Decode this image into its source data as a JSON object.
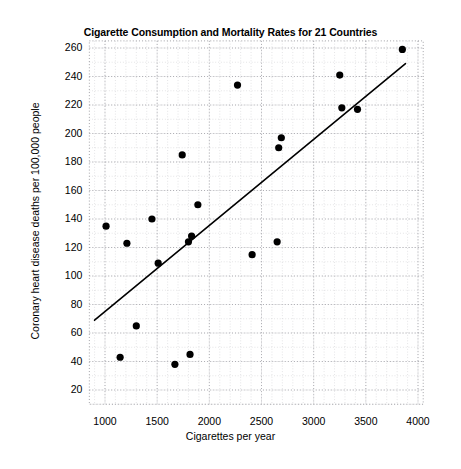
{
  "figure": {
    "background_color": "#ffffff",
    "width": 461,
    "height": 469
  },
  "top_strip_text": "",
  "chart_data": {
    "type": "scatter",
    "title": "Cigarette Consumption and Mortality Rates for 21 Countries",
    "xlabel": "Cigarettes per year",
    "ylabel": "Coronary heart disease deaths per 100,000 people",
    "xlim": [
      850,
      4050
    ],
    "ylim": [
      10,
      265
    ],
    "xticks": [
      1000,
      1500,
      2000,
      2500,
      3000,
      3500,
      4000
    ],
    "xtick_labels": [
      "1000",
      "1500",
      "2000",
      "2500",
      "3000",
      "3500",
      "4000"
    ],
    "yticks": [
      20,
      40,
      60,
      80,
      100,
      120,
      140,
      160,
      180,
      200,
      220,
      240,
      260
    ],
    "ytick_labels": [
      "20",
      "40",
      "60",
      "80",
      "100",
      "120",
      "140",
      "160",
      "180",
      "200",
      "220",
      "240",
      "260"
    ],
    "grid": true,
    "grid_style": "dotted",
    "grid_color": "#b9b9bd",
    "minor_grid": true,
    "legend": false,
    "marker_color": "#000000",
    "marker_size": 5,
    "points": [
      {
        "x": 1010,
        "y": 135
      },
      {
        "x": 1145,
        "y": 43
      },
      {
        "x": 1210,
        "y": 123
      },
      {
        "x": 1300,
        "y": 65
      },
      {
        "x": 1450,
        "y": 140
      },
      {
        "x": 1510,
        "y": 109
      },
      {
        "x": 1670,
        "y": 38
      },
      {
        "x": 1740,
        "y": 185
      },
      {
        "x": 1800,
        "y": 124
      },
      {
        "x": 1815,
        "y": 45
      },
      {
        "x": 1830,
        "y": 128
      },
      {
        "x": 1890,
        "y": 150
      },
      {
        "x": 2270,
        "y": 234
      },
      {
        "x": 2410,
        "y": 115
      },
      {
        "x": 2650,
        "y": 124
      },
      {
        "x": 2665,
        "y": 190
      },
      {
        "x": 2690,
        "y": 197
      },
      {
        "x": 3250,
        "y": 241
      },
      {
        "x": 3270,
        "y": 218
      },
      {
        "x": 3420,
        "y": 217
      },
      {
        "x": 3850,
        "y": 259
      }
    ],
    "trend_line": {
      "type": "linear-fit",
      "color": "#000000",
      "width": 1.6,
      "x_start": 900,
      "y_start": 69,
      "x_end": 3880,
      "y_end": 249
    }
  }
}
